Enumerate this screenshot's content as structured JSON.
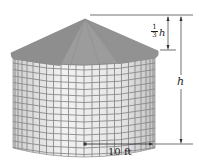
{
  "figure": {
    "labels": {
      "cone_height_fraction_num": "1",
      "cone_height_fraction_den": "3",
      "cone_height_var": "h",
      "total_height": "h",
      "radius": "10 ft"
    },
    "colors": {
      "roof": "#9a9a9a",
      "roof_dark": "#868686",
      "wall": "#e9e9e9",
      "grid": "#8a8a8a",
      "lines": "#333333"
    }
  }
}
